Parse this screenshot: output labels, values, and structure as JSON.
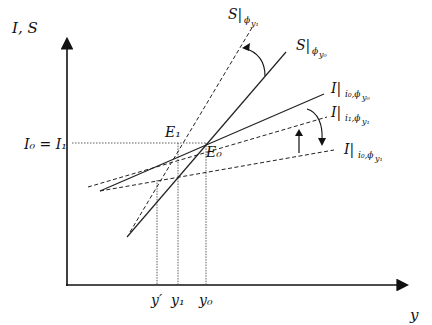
{
  "diagram": {
    "axes": {
      "y_label": "I, S",
      "x_label": "y",
      "y_tick_label": "I₀ = I₁",
      "x_tick_labels": [
        "y′",
        "y₁",
        "y₀"
      ]
    },
    "points": {
      "E1": "E₁",
      "E0": "E₀"
    },
    "curves": [
      {
        "id": "S_phi_y1",
        "main": "S|",
        "sub": "ϕ",
        "subsub": "y₁",
        "style": "dashed"
      },
      {
        "id": "S_phi_y0",
        "main": "S|",
        "sub": "ϕ",
        "subsub": "y₀",
        "style": "solid"
      },
      {
        "id": "I_i0_phi_y0",
        "main": "I|",
        "sub": "i₀,ϕ",
        "subsub": "y₀",
        "style": "solid"
      },
      {
        "id": "I_i1_phi_y1",
        "main": "I|",
        "sub": "i₁,ϕ",
        "subsub": "y₁",
        "style": "dashed"
      },
      {
        "id": "I_i0_phi_y1",
        "main": "I|",
        "sub": "i₀,ϕ",
        "subsub": "y₁",
        "style": "dashed"
      }
    ],
    "colors": {
      "line": "#222222",
      "background": "#ffffff"
    }
  }
}
